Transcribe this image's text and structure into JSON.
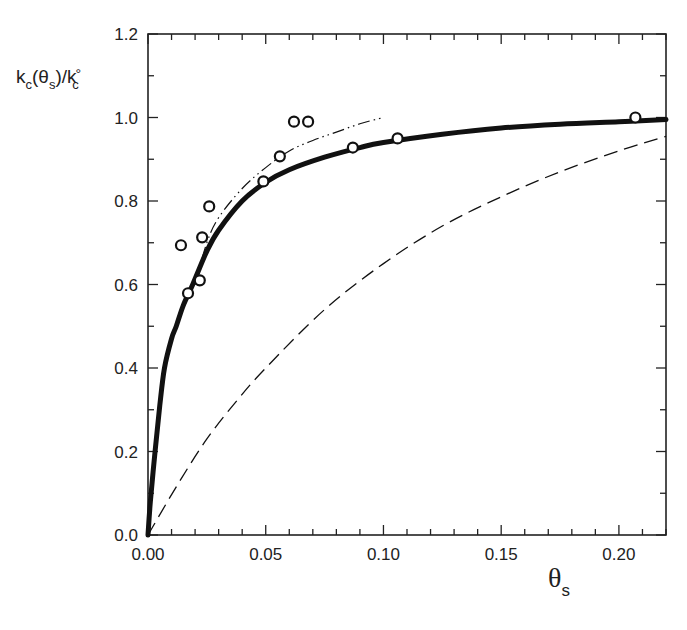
{
  "chart_data": {
    "type": "line",
    "title": "",
    "xlabel": "θs",
    "ylabel": "kc(θs)/kc°",
    "xlim": [
      0.0,
      0.22
    ],
    "ylim": [
      0.0,
      1.2
    ],
    "x_ticks": [
      "0.00",
      "0.05",
      "0.10",
      "0.15",
      "0.20"
    ],
    "x_tick_values": [
      0.0,
      0.05,
      0.1,
      0.15,
      0.2
    ],
    "y_ticks": [
      "0.0",
      "0.2",
      "0.4",
      "0.6",
      "0.8",
      "1.0",
      "1.2"
    ],
    "y_tick_values": [
      0.0,
      0.2,
      0.4,
      0.6,
      0.8,
      1.0,
      1.2
    ],
    "grid": false,
    "legend": null,
    "series": [
      {
        "name": "experimental data",
        "style": "open-circle",
        "x": [
          0.014,
          0.017,
          0.022,
          0.023,
          0.026,
          0.049,
          0.056,
          0.062,
          0.068,
          0.087,
          0.106,
          0.207
        ],
        "y": [
          0.694,
          0.579,
          0.61,
          0.713,
          0.787,
          0.847,
          0.907,
          0.99,
          0.99,
          0.928,
          0.95,
          1.0
        ]
      },
      {
        "name": "model (thick solid)",
        "style": "thick-solid",
        "x": [
          0.0,
          0.001,
          0.003,
          0.005,
          0.007,
          0.01,
          0.012,
          0.015,
          0.019,
          0.025,
          0.03,
          0.04,
          0.05,
          0.06,
          0.075,
          0.09,
          0.1,
          0.125,
          0.15,
          0.175,
          0.2,
          0.22
        ],
        "y": [
          0.0,
          0.08,
          0.2,
          0.31,
          0.4,
          0.47,
          0.5,
          0.55,
          0.6,
          0.68,
          0.73,
          0.8,
          0.845,
          0.875,
          0.905,
          0.928,
          0.94,
          0.96,
          0.975,
          0.984,
          0.99,
          0.995
        ]
      },
      {
        "name": "model (dash-dot-dot)",
        "style": "dash-dot",
        "x": [
          0.02,
          0.025,
          0.03,
          0.04,
          0.05,
          0.06,
          0.07,
          0.08,
          0.09,
          0.1
        ],
        "y": [
          0.6,
          0.7,
          0.76,
          0.83,
          0.88,
          0.92,
          0.945,
          0.965,
          0.985,
          1.0
        ]
      },
      {
        "name": "model (dashed)",
        "style": "dashed",
        "x": [
          0.0,
          0.0125,
          0.025,
          0.0375,
          0.05,
          0.075,
          0.1,
          0.125,
          0.15,
          0.175,
          0.2,
          0.22
        ],
        "y": [
          0.0,
          0.12,
          0.23,
          0.32,
          0.4,
          0.54,
          0.65,
          0.74,
          0.81,
          0.87,
          0.92,
          0.955
        ]
      }
    ]
  },
  "labels": {
    "ylabel_main": "k",
    "ylabel_sub1": "c",
    "ylabel_mid": "(θ",
    "ylabel_sub2": "s",
    "ylabel_mid2": ")/k",
    "ylabel_sup": "°",
    "ylabel_sub3": "c",
    "xlabel_main": "θ",
    "xlabel_sub": "s"
  },
  "colors": {
    "axis": "#222222",
    "line": "#111111",
    "marker_fill": "#ffffff"
  }
}
